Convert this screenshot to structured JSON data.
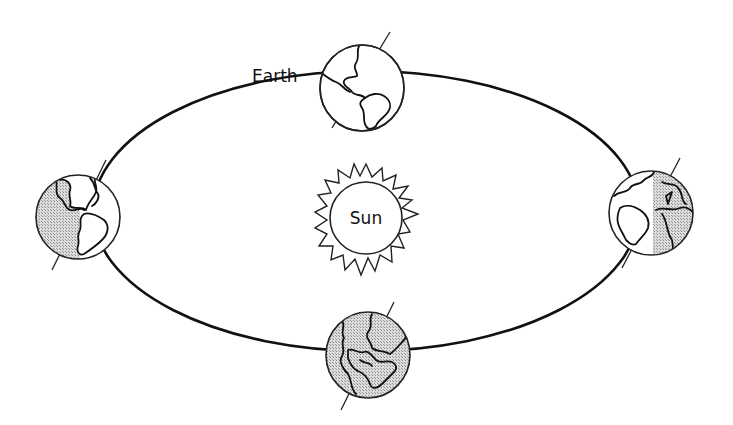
{
  "diagram": {
    "labels": {
      "earth": "Earth",
      "sun": "Sun"
    },
    "orbit": {
      "shape": "ellipse",
      "stroke_color": "#111111"
    },
    "earth_positions": [
      {
        "id": "top",
        "illumination": "fully lit",
        "shading": "none",
        "continents_visible": "Americas"
      },
      {
        "id": "left",
        "illumination": "half lit",
        "shading": "left half",
        "continents_visible": "Americas"
      },
      {
        "id": "right",
        "illumination": "half lit",
        "shading": "right half",
        "continents_visible": "Africa / Europe"
      },
      {
        "id": "bottom",
        "illumination": "dark",
        "shading": "full",
        "continents_visible": "Asia / India / Africa"
      }
    ],
    "colors": {
      "background": "#ffffff",
      "line": "#111111",
      "shade": "#c8c8c8"
    }
  }
}
